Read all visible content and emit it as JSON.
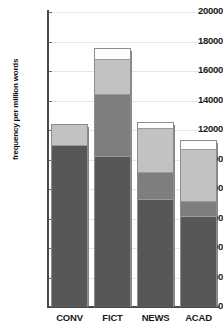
{
  "chart_data": {
    "type": "bar",
    "subtype": "stacked",
    "title": "",
    "xlabel": "",
    "ylabel": "frequency per million words",
    "ylim": [
      0,
      20000
    ],
    "ytick_step": 2000,
    "yticks": [
      "0",
      "2000",
      "4000",
      "6000",
      "8000",
      "10000",
      "12000",
      "14000",
      "16000",
      "18000",
      "20000"
    ],
    "grid": true,
    "legend": "none",
    "categories": [
      "CONV",
      "FICT",
      "NEWS",
      "ACAD"
    ],
    "series": [
      {
        "name": "segment-1-dark",
        "color": "#575757",
        "values": [
          11050,
          10300,
          7400,
          6230
        ]
      },
      {
        "name": "segment-2-medium",
        "color": "#7e7e7e",
        "values": [
          0,
          4200,
          1850,
          1020
        ]
      },
      {
        "name": "segment-3-light",
        "color": "#c2c2c2",
        "values": [
          1350,
          2400,
          2950,
          3530
        ]
      },
      {
        "name": "segment-4-white",
        "color": "#ffffff",
        "values": [
          0,
          650,
          350,
          550
        ]
      }
    ],
    "totals": [
      12400,
      17550,
      12550,
      11330
    ]
  },
  "axis": {
    "y_title": "frequency per million words"
  },
  "colors": {
    "dark": "#575757",
    "medium": "#7e7e7e",
    "light": "#c2c2c2",
    "white": "#ffffff",
    "axis": "#4a4a4a",
    "grid": "#e9e6e2",
    "border": "#8d8d8d"
  }
}
